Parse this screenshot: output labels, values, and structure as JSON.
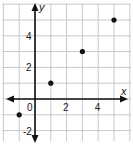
{
  "chart_data": {
    "type": "scatter",
    "title": "",
    "xlabel": "x",
    "ylabel": "y",
    "xlim": [
      -2,
      6
    ],
    "ylim": [
      -3,
      6
    ],
    "grid": true,
    "x_ticks": [
      {
        "value": 0,
        "label": "0"
      },
      {
        "value": 2,
        "label": "2"
      },
      {
        "value": 4,
        "label": "4"
      }
    ],
    "y_ticks": [
      {
        "value": 4,
        "label": "4"
      },
      {
        "value": 2,
        "label": "2"
      },
      {
        "value": -2,
        "label": "-2"
      }
    ],
    "points": [
      {
        "x": -1,
        "y": -1
      },
      {
        "x": 1,
        "y": 1
      },
      {
        "x": 3,
        "y": 3
      },
      {
        "x": 5,
        "y": 5
      }
    ]
  },
  "style": {
    "point_color": "#111111",
    "grid_color": "#c8c8c8",
    "axis_color": "#111111"
  }
}
